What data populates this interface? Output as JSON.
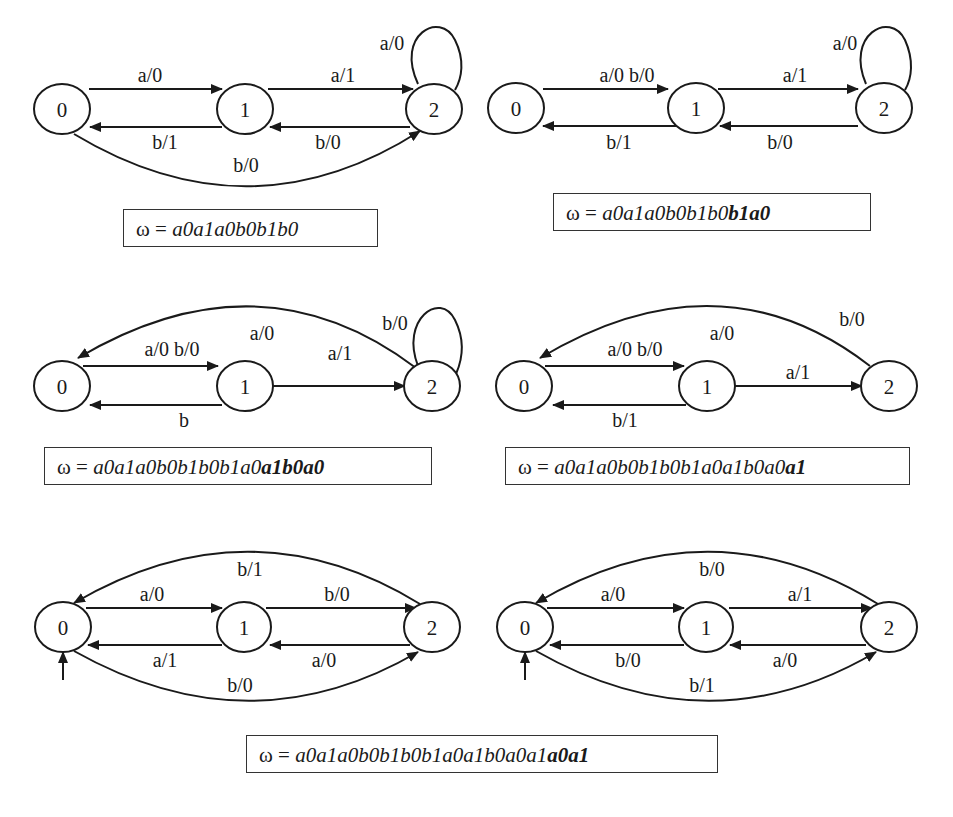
{
  "figure": {
    "node_labels": [
      "0",
      "1",
      "2"
    ],
    "diagrams": [
      {
        "id": "d1",
        "edges": [
          {
            "from": "0",
            "to": "1",
            "label": "a/0"
          },
          {
            "from": "1",
            "to": "2",
            "label": "a/1"
          },
          {
            "from": "1",
            "to": "0",
            "label": "b/1"
          },
          {
            "from": "2",
            "to": "1",
            "label": "b/0"
          },
          {
            "from": "0",
            "to": "2",
            "label": "b/0"
          },
          {
            "from": "2",
            "to": "2",
            "label": "a/0"
          }
        ],
        "omega": {
          "prefix": "ω = ",
          "plain": "a0a1a0b0b1b0",
          "bold": ""
        }
      },
      {
        "id": "d2",
        "edges": [
          {
            "from": "0",
            "to": "1",
            "label": "a/0 b/0"
          },
          {
            "from": "1",
            "to": "2",
            "label": "a/1"
          },
          {
            "from": "1",
            "to": "0",
            "label": "b/1"
          },
          {
            "from": "2",
            "to": "1",
            "label": "b/0"
          },
          {
            "from": "2",
            "to": "2",
            "label": "a/0"
          }
        ],
        "omega": {
          "prefix": "ω = ",
          "plain": "a0a1a0b0b1b0",
          "bold": "b1a0"
        }
      },
      {
        "id": "d3",
        "edges": [
          {
            "from": "0",
            "to": "1",
            "label": "a/0 b/0"
          },
          {
            "from": "1",
            "to": "2",
            "label": "a/1"
          },
          {
            "from": "1",
            "to": "0",
            "label": "b"
          },
          {
            "from": "2",
            "to": "0",
            "label": "a/0"
          },
          {
            "from": "2",
            "to": "2",
            "label": "b/0"
          }
        ],
        "omega": {
          "prefix": "ω = ",
          "plain": "a0a1a0b0b1b0b1a0",
          "bold": "a1b0a0"
        }
      },
      {
        "id": "d4",
        "edges": [
          {
            "from": "0",
            "to": "1",
            "label": "a/0 b/0"
          },
          {
            "from": "1",
            "to": "2",
            "label": "a/1"
          },
          {
            "from": "1",
            "to": "0",
            "label": "b/1"
          },
          {
            "from": "2",
            "to": "0",
            "label": "a/0 b/0"
          }
        ],
        "labels_extra": {
          "arc_a": "a/0",
          "arc_b": "b/0"
        },
        "omega": {
          "prefix": "ω = ",
          "plain": "a0a1a0b0b1b0b1a0a1b0a0",
          "bold": "a1"
        }
      },
      {
        "id": "d5",
        "initial_state": "0",
        "edges": [
          {
            "from": "0",
            "to": "1",
            "label": "a/0"
          },
          {
            "from": "1",
            "to": "2",
            "label": "b/0"
          },
          {
            "from": "1",
            "to": "0",
            "label": "a/1"
          },
          {
            "from": "2",
            "to": "1",
            "label": "a/0"
          },
          {
            "from": "2",
            "to": "0",
            "label": "b/1"
          },
          {
            "from": "0",
            "to": "2",
            "label": "b/0"
          }
        ]
      },
      {
        "id": "d6",
        "initial_state": "0",
        "edges": [
          {
            "from": "0",
            "to": "1",
            "label": "a/0"
          },
          {
            "from": "1",
            "to": "2",
            "label": "a/1"
          },
          {
            "from": "1",
            "to": "0",
            "label": "b/0"
          },
          {
            "from": "2",
            "to": "1",
            "label": "a/0"
          },
          {
            "from": "2",
            "to": "0",
            "label": "b/0"
          },
          {
            "from": "0",
            "to": "2",
            "label": "b/1"
          }
        ]
      }
    ],
    "final_omega": {
      "prefix": "ω = ",
      "plain": "a0a1a0b0b1b0b1a0a1b0a0a1",
      "bold": "a0a1"
    }
  }
}
